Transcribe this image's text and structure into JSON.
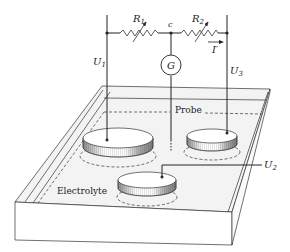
{
  "diagram": {
    "type": "electrochemical probe measurement setup",
    "labels": {
      "R1": {
        "main": "R",
        "sub": "1"
      },
      "R2": {
        "main": "R",
        "sub": "2"
      },
      "node_c": "c",
      "galvanometer": "G",
      "current": "I′",
      "U1": {
        "main": "U",
        "sub": "1"
      },
      "U2": {
        "main": "U",
        "sub": "2"
      },
      "U3": {
        "main": "U",
        "sub": "3"
      },
      "probe": "Probe",
      "electrolyte": "Electrolyte"
    },
    "colors": {
      "line": "#222222",
      "tray_top": "#f2f2f2",
      "tray_side": "#ffffff",
      "disc_fill": "#ffffff"
    },
    "components": [
      {
        "id": "R1",
        "kind": "variable-resistor"
      },
      {
        "id": "R2",
        "kind": "variable-resistor"
      },
      {
        "id": "G",
        "kind": "galvanometer"
      },
      {
        "id": "electrode-left",
        "kind": "disc-electrode",
        "voltage": "U1"
      },
      {
        "id": "electrode-right",
        "kind": "disc-electrode",
        "voltage": "U3"
      },
      {
        "id": "electrode-front",
        "kind": "disc-electrode",
        "voltage": "U2"
      },
      {
        "id": "probe",
        "kind": "probe-wire",
        "connected_to": "G"
      }
    ]
  }
}
